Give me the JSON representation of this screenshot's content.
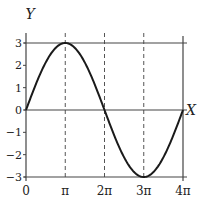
{
  "chart_data": {
    "type": "line",
    "title": "",
    "xlabel": "X",
    "ylabel": "Y",
    "xlim": [
      0,
      12.566
    ],
    "ylim": [
      -3,
      3
    ],
    "x_ticks": [
      {
        "value": 0,
        "label": "0"
      },
      {
        "value": 3.1416,
        "label": "π"
      },
      {
        "value": 6.2832,
        "label": "2π"
      },
      {
        "value": 9.4248,
        "label": "3π"
      },
      {
        "value": 12.566,
        "label": "4π"
      }
    ],
    "y_ticks": [
      {
        "value": 3,
        "label": "3"
      },
      {
        "value": 2,
        "label": "2"
      },
      {
        "value": 1,
        "label": "1"
      },
      {
        "value": 0,
        "label": "0"
      },
      {
        "value": -1,
        "label": "−1"
      },
      {
        "value": -2,
        "label": "−2"
      },
      {
        "value": -3,
        "label": "−3"
      }
    ],
    "grid": {
      "vertical_dashed_at": [
        3.1416,
        6.2832,
        9.4248
      ],
      "horizontal_solid_at": [
        3,
        0,
        -3
      ]
    },
    "series": [
      {
        "name": "y = 3 sin(x/2)",
        "function": "3*sin(x/2)",
        "x": [
          0,
          1.5708,
          3.1416,
          4.7124,
          6.2832,
          7.854,
          9.4248,
          10.9956,
          12.566
        ],
        "values": [
          0,
          2.12,
          3,
          2.12,
          0,
          -2.12,
          -3,
          -2.12,
          0
        ],
        "color": "#1a1a1a"
      }
    ],
    "legend": null
  }
}
